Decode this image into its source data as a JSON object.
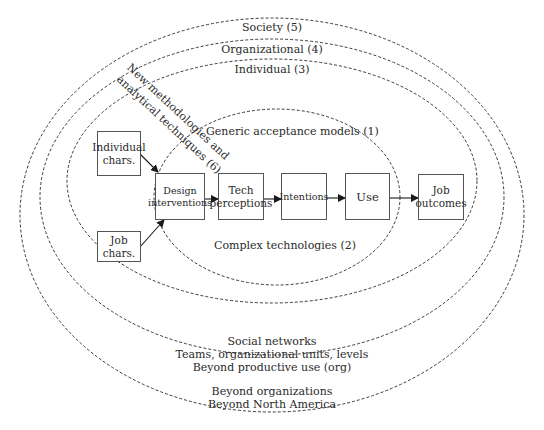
{
  "diagram": {
    "rings": [
      {
        "id": "society",
        "label": "Society (5)"
      },
      {
        "id": "organizational",
        "label": "Organizational (4)"
      },
      {
        "id": "individual",
        "label": "Individual (3)"
      },
      {
        "id": "generic",
        "label": "Generic acceptance models (1)"
      },
      {
        "id": "complex",
        "label": "Complex technologies (2)"
      }
    ],
    "diagonal_label": {
      "line1": "New methodologies and",
      "line2": "analytical techniques (6)"
    },
    "boxes": {
      "individual_chars": "Individual\nchars.",
      "job_chars": "Job\nchars.",
      "design_interventions": "Design\ninterventions",
      "tech_perceptions": "Tech\nperceptions",
      "intentions": "Intentions",
      "use": "Use",
      "job_outcomes": "Job\noutcomes"
    },
    "bottom_notes": {
      "organizational": [
        "Social networks",
        "Teams, organizational units, levels",
        "Beyond productive use (org)"
      ],
      "society": [
        "Beyond organizations",
        "Beyond North America"
      ]
    },
    "colors": {
      "line": "#3a3a3a",
      "text": "#2a2a2a",
      "background": "#ffffff"
    }
  }
}
